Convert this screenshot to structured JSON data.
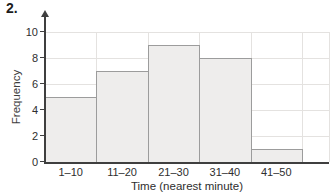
{
  "figure": {
    "number": "2."
  },
  "chart_data": {
    "type": "bar",
    "subtype": "histogram",
    "title": "",
    "categories": [
      "1–10",
      "11–20",
      "21–30",
      "31–40",
      "41–50"
    ],
    "values": [
      5,
      7,
      9,
      8,
      1
    ],
    "xlabel": "Time (nearest minute)",
    "ylabel": "Frequency",
    "ylim": [
      0,
      10
    ],
    "yticks": [
      0,
      2,
      4,
      6,
      8,
      10
    ],
    "grid": true,
    "bar_gap": 0,
    "legend": "none",
    "colors": {
      "bar_fill": "#eeedec",
      "bar_border": "#9c9c9c",
      "gridline": "#e4e2e0",
      "axis": "#3f3f3f",
      "text": "#2e2e2e",
      "background": "#ffffff"
    }
  }
}
